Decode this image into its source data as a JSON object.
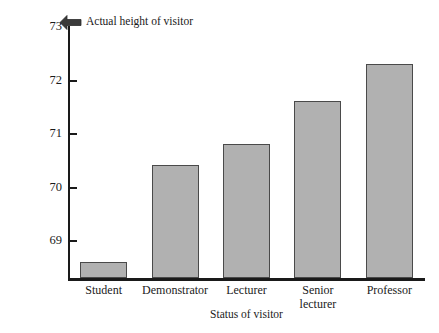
{
  "chart_data": {
    "type": "bar",
    "title": "",
    "subtitle": "",
    "xlabel": "Status of visitor",
    "ylabel": "Mean perceived height (inches)",
    "categories": [
      "Student",
      "Demonstrator",
      "Lecturer",
      "Senior lecturer",
      "Professor"
    ],
    "category_lines": [
      [
        "Student"
      ],
      [
        "Demonstrator"
      ],
      [
        "Lecturer"
      ],
      [
        "Senior",
        "lecturer"
      ],
      [
        "Professor"
      ]
    ],
    "values": [
      68.6,
      70.4,
      70.8,
      71.6,
      72.3
    ],
    "ylim": [
      68.3,
      73.0
    ],
    "yticks": [
      69,
      70,
      71,
      72,
      73
    ],
    "ytick_labels": [
      "69",
      "70",
      "71",
      "72",
      "73"
    ],
    "grid": false,
    "legend": "none",
    "bar_color": "#b1b1b1",
    "bar_edge_color": "#4a4a4a",
    "axis_color": "#1a1a1a",
    "annotations": [
      {
        "text": "Actual height of visitor",
        "icon": "left-arrow-icon",
        "y_value": 73,
        "points_to": "y-axis-top"
      }
    ]
  }
}
